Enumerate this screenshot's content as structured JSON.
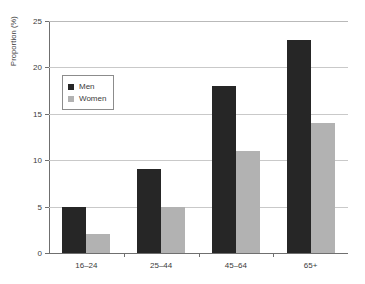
{
  "chart_data": {
    "type": "bar",
    "title": "",
    "subtitle": "",
    "xlabel": "",
    "ylabel": "Proportion (%)",
    "categories": [
      "16–24",
      "25–44",
      "45–64",
      "65+"
    ],
    "series": [
      {
        "name": "Men",
        "color": "#262626",
        "values": [
          5,
          9,
          18,
          23
        ]
      },
      {
        "name": "Women",
        "color": "#b2b2b2",
        "values": [
          2,
          5,
          11,
          14
        ]
      }
    ],
    "ylim": [
      0,
      25
    ],
    "yticks": [
      0,
      5,
      10,
      15,
      20,
      25
    ],
    "ytick_labels": [
      "0",
      "5",
      "10",
      "15",
      "20",
      "25"
    ],
    "grid": "horizontal",
    "legend_position": "upper-left-inside",
    "axis_color": "#6f6f6f",
    "grid_color": "#c9c9c9",
    "background": "#ffffff"
  },
  "legend": {
    "items": [
      {
        "label": "Men",
        "swatch": "men-swatch"
      },
      {
        "label": "Women",
        "swatch": "women-swatch"
      }
    ]
  }
}
